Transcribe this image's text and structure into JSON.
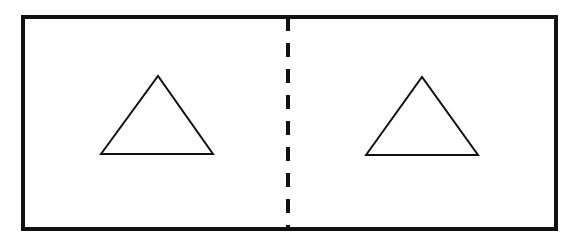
{
  "diagram": {
    "width": 584,
    "height": 250,
    "background": "#ffffff",
    "stroke_color": "#111111",
    "outer_box": {
      "x": 23,
      "y": 17,
      "width": 533,
      "height": 212,
      "stroke_width": 4
    },
    "divider": {
      "x": 288,
      "y1": 17,
      "y2": 229,
      "stroke_width": 4,
      "dash": "14 12",
      "style": "dashed"
    },
    "panels": [
      {
        "name": "left-panel",
        "shape": "triangle",
        "points": [
          [
            101,
            154
          ],
          [
            158,
            76
          ],
          [
            213,
            154
          ]
        ],
        "stroke_width": 2,
        "fill": "none"
      },
      {
        "name": "right-panel",
        "shape": "triangle",
        "points": [
          [
            366,
            155
          ],
          [
            422,
            77
          ],
          [
            478,
            155
          ]
        ],
        "stroke_width": 2,
        "fill": "none"
      }
    ]
  }
}
